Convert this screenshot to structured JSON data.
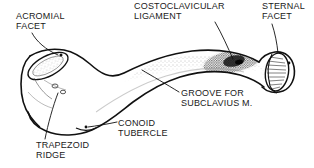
{
  "figure": {
    "view": "inferior",
    "background_color": "#ffffff",
    "ink_color": "#1a1a1a",
    "stipple_color": "#4a4a4a"
  },
  "labels": {
    "acromial_facet": "ACROMIAL\nFACET",
    "costoclavicular_ligament": "COSTOCLAVICULAR\nLIGAMENT",
    "sternal_facet": "STERNAL\nFACET",
    "groove_for_subclavius": "GROOVE FOR\nSUBCLAVIUS M.",
    "conoid_tubercle": "CONOID\nTUBERCLE",
    "trapezoid_ridge": "TRAPEZOID\nRIDGE"
  }
}
